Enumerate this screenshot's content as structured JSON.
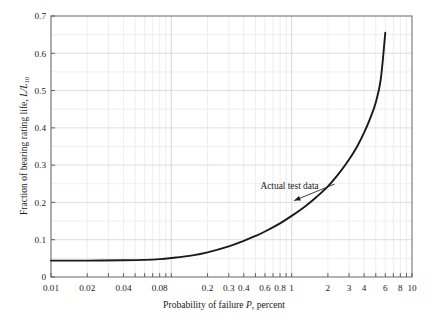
{
  "chart_data": {
    "type": "line",
    "title": "",
    "xlabel": "Probability of failure P, percent",
    "ylabel": "Fraction of bearing rating life, L/L10",
    "xscale": "log",
    "yscale": "linear",
    "xlim": [
      0.01,
      10
    ],
    "ylim": [
      0,
      0.7
    ],
    "grid": true,
    "legend": "none",
    "xticks": [
      0.01,
      0.02,
      0.04,
      0.08,
      0.2,
      0.3,
      0.4,
      0.6,
      0.8,
      1,
      2,
      3,
      4,
      6,
      8,
      10
    ],
    "xtick_labels": [
      "0.01",
      "0.02",
      "0.04",
      "0.08",
      "0.2",
      "0.3",
      "0.4",
      "0.6",
      "0.8",
      "1",
      "2",
      "3",
      "4",
      "6",
      "8",
      "10"
    ],
    "yticks": [
      0,
      0.1,
      0.2,
      0.3,
      0.4,
      0.5,
      0.6,
      0.7
    ],
    "ytick_labels": [
      "0",
      "0.1",
      "0.2",
      "0.3",
      "0.4",
      "0.5",
      "0.6",
      "0.7"
    ],
    "series": [
      {
        "name": "Actual test data",
        "x": [
          0.01,
          0.02,
          0.04,
          0.06,
          0.08,
          0.1,
          0.15,
          0.2,
          0.3,
          0.4,
          0.5,
          0.6,
          0.8,
          1.0,
          1.3,
          1.6,
          2.0,
          2.5,
          3.0,
          3.5,
          4.0,
          4.5,
          5.0,
          5.5,
          6.0
        ],
        "y": [
          0.044,
          0.044,
          0.045,
          0.046,
          0.048,
          0.051,
          0.058,
          0.066,
          0.082,
          0.097,
          0.11,
          0.122,
          0.144,
          0.164,
          0.19,
          0.214,
          0.243,
          0.28,
          0.315,
          0.35,
          0.387,
          0.426,
          0.468,
          0.53,
          0.655
        ]
      }
    ],
    "annotations": [
      {
        "text": "Actual test data",
        "x": 0.55,
        "y": 0.245,
        "arrow_to_x": 1.05,
        "arrow_to_y": 0.205
      }
    ]
  },
  "axis": {
    "y_title_main": "Fraction of bearing rating life, ",
    "y_title_var": "L/L",
    "y_title_sub": "10",
    "x_title_pre": "Probability of failure ",
    "x_title_var": "P",
    "x_title_post": ", percent"
  },
  "colors": {
    "curve": "#1a1a1a",
    "frame": "#555555",
    "grid_major": "#d8d8dc",
    "grid_minor": "#eaeaee",
    "background": "#ffffff",
    "text": "#1a1a1a"
  }
}
